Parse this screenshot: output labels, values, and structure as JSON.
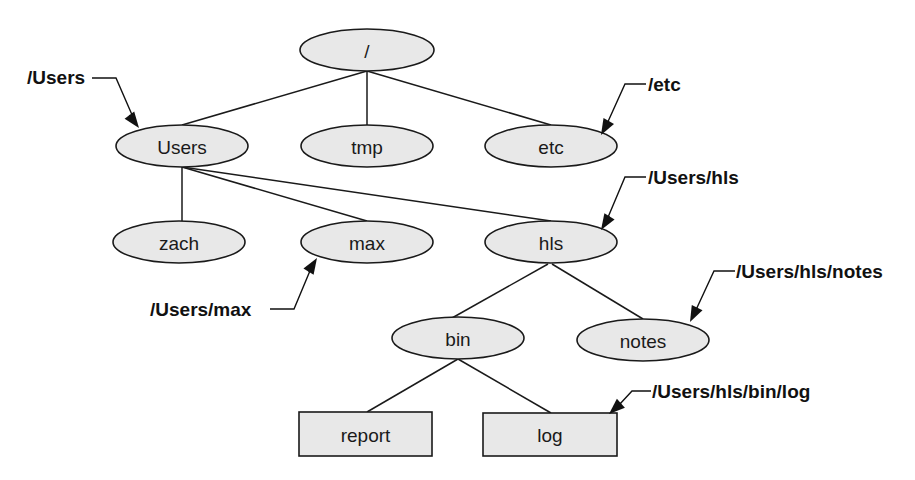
{
  "diagram": {
    "type": "file-system-tree",
    "nodes": [
      {
        "id": "root",
        "label": "/",
        "shape": "ellipse",
        "cx": 367,
        "cy": 50,
        "rx": 67,
        "ry": 21
      },
      {
        "id": "users",
        "label": "Users",
        "shape": "ellipse",
        "cx": 182,
        "cy": 146,
        "rx": 66,
        "ry": 21
      },
      {
        "id": "tmp",
        "label": "tmp",
        "shape": "ellipse",
        "cx": 367,
        "cy": 146,
        "rx": 66,
        "ry": 21
      },
      {
        "id": "etc",
        "label": "etc",
        "shape": "ellipse",
        "cx": 551,
        "cy": 146,
        "rx": 66,
        "ry": 21
      },
      {
        "id": "zach",
        "label": "zach",
        "shape": "ellipse",
        "cx": 179,
        "cy": 242,
        "rx": 66,
        "ry": 21
      },
      {
        "id": "max",
        "label": "max",
        "shape": "ellipse",
        "cx": 367,
        "cy": 242,
        "rx": 66,
        "ry": 21
      },
      {
        "id": "hls",
        "label": "hls",
        "shape": "ellipse",
        "cx": 551,
        "cy": 242,
        "rx": 66,
        "ry": 21
      },
      {
        "id": "bin",
        "label": "bin",
        "shape": "ellipse",
        "cx": 458,
        "cy": 338,
        "rx": 66,
        "ry": 21
      },
      {
        "id": "notes",
        "label": "notes",
        "shape": "ellipse",
        "cx": 643,
        "cy": 340,
        "rx": 66,
        "ry": 21
      },
      {
        "id": "report",
        "label": "report",
        "shape": "rect",
        "x": 299,
        "y": 412,
        "w": 133,
        "h": 44
      },
      {
        "id": "log",
        "label": "log",
        "shape": "rect",
        "x": 483,
        "y": 413,
        "w": 134,
        "h": 43
      }
    ],
    "edges": [
      {
        "from": "root",
        "to": "users",
        "x1": 367,
        "y1": 71,
        "x2": 182,
        "y2": 125
      },
      {
        "from": "root",
        "to": "tmp",
        "x1": 367,
        "y1": 71,
        "x2": 367,
        "y2": 125
      },
      {
        "from": "root",
        "to": "etc",
        "x1": 367,
        "y1": 71,
        "x2": 551,
        "y2": 125
      },
      {
        "from": "users",
        "to": "zach",
        "x1": 182,
        "y1": 167,
        "x2": 182,
        "y2": 221
      },
      {
        "from": "users",
        "to": "max",
        "x1": 182,
        "y1": 167,
        "x2": 367,
        "y2": 221
      },
      {
        "from": "users",
        "to": "hls",
        "x1": 182,
        "y1": 167,
        "x2": 551,
        "y2": 221
      },
      {
        "from": "hls",
        "to": "bin",
        "x1": 548,
        "y1": 264,
        "x2": 452,
        "y2": 318
      },
      {
        "from": "hls",
        "to": "notes",
        "x1": 552,
        "y1": 264,
        "x2": 643,
        "y2": 319
      },
      {
        "from": "bin",
        "to": "report",
        "x1": 458,
        "y1": 359,
        "x2": 367,
        "y2": 412
      },
      {
        "from": "bin",
        "to": "log",
        "x1": 458,
        "y1": 359,
        "x2": 551,
        "y2": 413
      }
    ],
    "callouts": [
      {
        "id": "callout-users",
        "label": "/Users",
        "target": "users",
        "text_x": 27,
        "text_y": 77,
        "anchor": "start",
        "path": "M 92 78 L 116 78 L 136 124",
        "tip": [
          139,
          128
        ]
      },
      {
        "id": "callout-etc",
        "label": "/etc",
        "target": "etc",
        "text_x": 648,
        "text_y": 84,
        "anchor": "start",
        "path": "M 646 84 L 625 84 L 606 126",
        "tip": [
          601,
          135
        ]
      },
      {
        "id": "callout-hls",
        "label": "/Users/hls",
        "target": "hls",
        "text_x": 648,
        "text_y": 177,
        "anchor": "start",
        "path": "M 646 177 L 625 177 L 606 222",
        "tip": [
          601,
          230
        ]
      },
      {
        "id": "callout-max",
        "label": "/Users/max",
        "target": "max",
        "text_x": 150,
        "text_y": 309,
        "anchor": "start",
        "path": "M 270 309 L 294 309 L 312 266",
        "tip": [
          317,
          258
        ]
      },
      {
        "id": "callout-notes",
        "label": "/Users/hls/notes",
        "target": "notes",
        "text_x": 736,
        "text_y": 271,
        "anchor": "start",
        "path": "M 735 271 L 714 271 L 695 312",
        "tip": [
          690,
          322
        ]
      },
      {
        "id": "callout-log",
        "label": "/Users/hls/bin/log",
        "target": "log",
        "text_x": 652,
        "text_y": 391,
        "anchor": "start",
        "path": "M 651 391 L 632 391 L 619 405",
        "tip": [
          609,
          414
        ]
      }
    ]
  }
}
